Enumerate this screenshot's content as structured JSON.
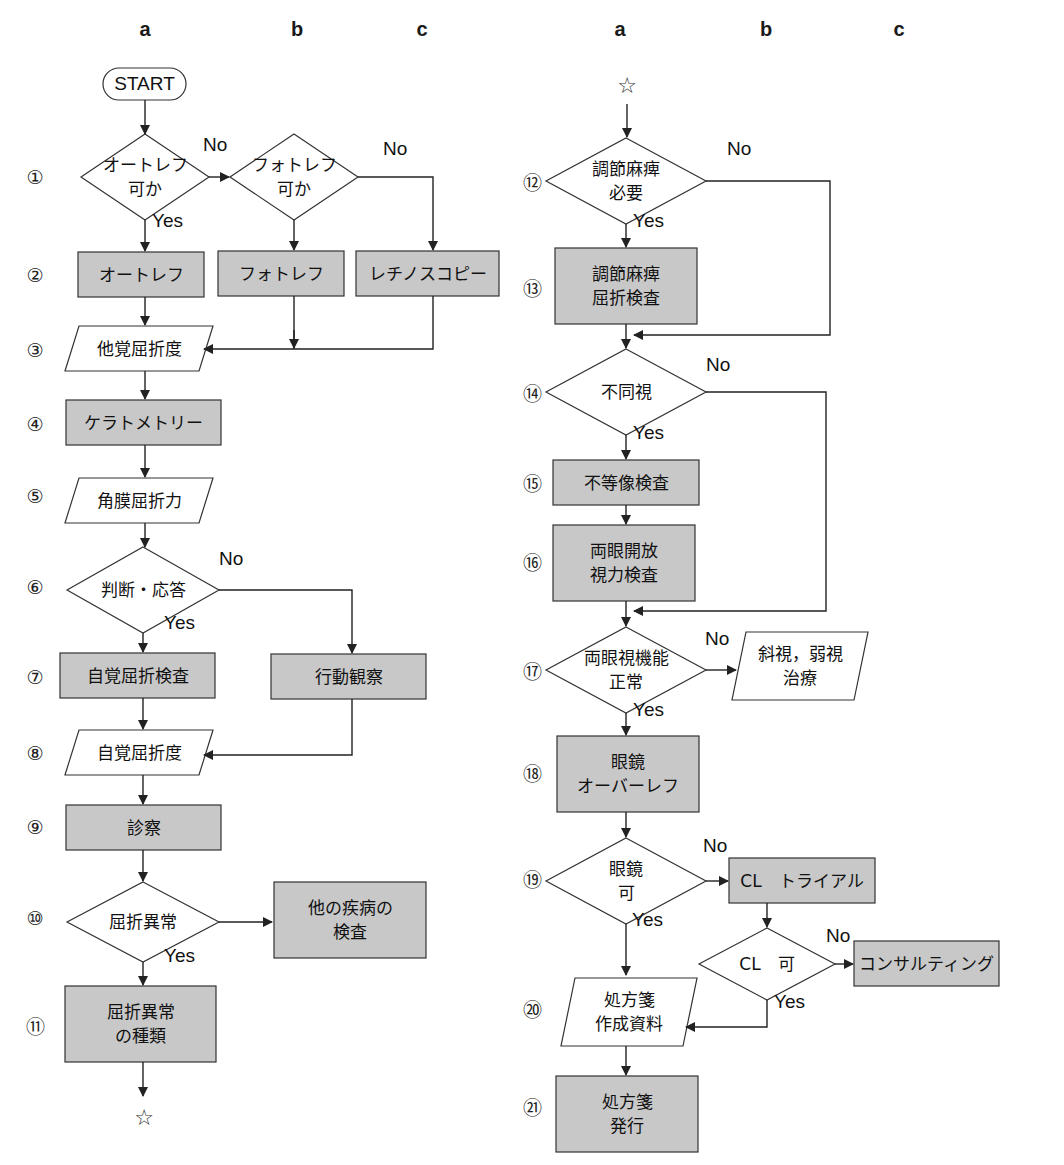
{
  "diagram": {
    "colors": {
      "process_fill": "#c8c8c8",
      "io_fill": "#ffffff",
      "stroke": "#333333",
      "line": "#222222"
    },
    "column_headers": [
      {
        "label": "a",
        "x": 145,
        "y": 30
      },
      {
        "label": "b",
        "x": 297,
        "y": 30
      },
      {
        "label": "c",
        "x": 422,
        "y": 30
      },
      {
        "label": "a",
        "x": 620,
        "y": 30
      },
      {
        "label": "b",
        "x": 766,
        "y": 30
      },
      {
        "label": "c",
        "x": 899,
        "y": 30
      }
    ],
    "step_numbers": [
      {
        "label": "①",
        "x": 35,
        "y": 177
      },
      {
        "label": "②",
        "x": 35,
        "y": 275
      },
      {
        "label": "③",
        "x": 35,
        "y": 350
      },
      {
        "label": "④",
        "x": 35,
        "y": 424
      },
      {
        "label": "⑤",
        "x": 35,
        "y": 496
      },
      {
        "label": "⑥",
        "x": 35,
        "y": 587
      },
      {
        "label": "⑦",
        "x": 35,
        "y": 677
      },
      {
        "label": "⑧",
        "x": 35,
        "y": 753
      },
      {
        "label": "⑨",
        "x": 35,
        "y": 827
      },
      {
        "label": "⑩",
        "x": 35,
        "y": 918
      },
      {
        "label": "⑪",
        "x": 35,
        "y": 1025
      },
      {
        "label": "⑫",
        "x": 532,
        "y": 181
      },
      {
        "label": "⑬",
        "x": 532,
        "y": 287
      },
      {
        "label": "⑭",
        "x": 532,
        "y": 392
      },
      {
        "label": "⑮",
        "x": 532,
        "y": 482
      },
      {
        "label": "⑯",
        "x": 532,
        "y": 561
      },
      {
        "label": "⑰",
        "x": 532,
        "y": 670
      },
      {
        "label": "⑱",
        "x": 532,
        "y": 772
      },
      {
        "label": "⑲",
        "x": 532,
        "y": 878
      },
      {
        "label": "⑳",
        "x": 532,
        "y": 1008
      },
      {
        "label": "㉑",
        "x": 532,
        "y": 1106
      }
    ],
    "nodes": [
      {
        "id": "start",
        "type": "terminal",
        "label": "START",
        "x": 103,
        "y": 68,
        "w": 83,
        "h": 32
      },
      {
        "id": "n1a",
        "type": "decision",
        "label": "オートレフ\n可か",
        "cx": 145,
        "cy": 177,
        "w": 128,
        "h": 86
      },
      {
        "id": "n1b",
        "type": "decision",
        "label": "フォトレフ\n可か",
        "cx": 294,
        "cy": 177,
        "w": 128,
        "h": 86
      },
      {
        "id": "n2a",
        "type": "process",
        "label": "オートレフ",
        "x": 78,
        "y": 252,
        "w": 126,
        "h": 45
      },
      {
        "id": "n2b",
        "type": "process",
        "label": "フォトレフ",
        "x": 218,
        "y": 251,
        "w": 126,
        "h": 45
      },
      {
        "id": "n2c",
        "type": "process",
        "label": "レチノスコピー",
        "x": 356,
        "y": 251,
        "w": 143,
        "h": 45
      },
      {
        "id": "n3",
        "type": "io",
        "label": "他覚屈折度",
        "x": 65,
        "y": 326,
        "w": 148,
        "h": 45
      },
      {
        "id": "n4",
        "type": "process",
        "label": "ケラトメトリー",
        "x": 66,
        "y": 400,
        "w": 155,
        "h": 45
      },
      {
        "id": "n5",
        "type": "io",
        "label": "角膜屈折力",
        "x": 65,
        "y": 478,
        "w": 148,
        "h": 45
      },
      {
        "id": "n6",
        "type": "decision",
        "label": "判断・応答",
        "cx": 143,
        "cy": 590,
        "w": 152,
        "h": 86
      },
      {
        "id": "n7a",
        "type": "process",
        "label": "自覚屈折検査",
        "x": 60,
        "y": 653,
        "w": 155,
        "h": 45
      },
      {
        "id": "n7b",
        "type": "process",
        "label": "行動観察",
        "x": 271,
        "y": 654,
        "w": 155,
        "h": 45
      },
      {
        "id": "n8",
        "type": "io",
        "label": "自覚屈折度",
        "x": 65,
        "y": 730,
        "w": 148,
        "h": 45
      },
      {
        "id": "n9",
        "type": "process",
        "label": "診察",
        "x": 66,
        "y": 805,
        "w": 155,
        "h": 45
      },
      {
        "id": "n10a",
        "type": "decision",
        "label": "屈折異常",
        "cx": 143,
        "cy": 922,
        "w": 152,
        "h": 80
      },
      {
        "id": "n10b",
        "type": "process",
        "label": "他の疾病の\n検査",
        "x": 274,
        "y": 882,
        "w": 152,
        "h": 76
      },
      {
        "id": "n11",
        "type": "process",
        "label": "屈折異常\nの種類",
        "x": 65,
        "y": 986,
        "w": 151,
        "h": 76
      },
      {
        "id": "n12",
        "type": "decision",
        "label": "調節麻痺\n必要",
        "cx": 626,
        "cy": 181,
        "w": 160,
        "h": 86
      },
      {
        "id": "n13",
        "type": "process",
        "label": "調節麻痺\n屈折検査",
        "x": 555,
        "y": 248,
        "w": 142,
        "h": 76
      },
      {
        "id": "n14",
        "type": "decision",
        "label": "不同視",
        "cx": 626,
        "cy": 392,
        "w": 160,
        "h": 86
      },
      {
        "id": "n15",
        "type": "process",
        "label": "不等像検査",
        "x": 553,
        "y": 460,
        "w": 146,
        "h": 45
      },
      {
        "id": "n16",
        "type": "process",
        "label": "両眼開放\n視力検査",
        "x": 553,
        "y": 525,
        "w": 142,
        "h": 76
      },
      {
        "id": "n17a",
        "type": "decision",
        "label": "両眼視機能\n正常",
        "cx": 626,
        "cy": 670,
        "w": 160,
        "h": 86
      },
      {
        "id": "n17b",
        "type": "io",
        "label": "斜視，弱視\n治療",
        "x": 732,
        "y": 632,
        "w": 136,
        "h": 68
      },
      {
        "id": "n18",
        "type": "process",
        "label": "眼鏡\nオーバーレフ",
        "x": 557,
        "y": 736,
        "w": 142,
        "h": 76
      },
      {
        "id": "n19a",
        "type": "decision",
        "label": "眼鏡\n可",
        "cx": 626,
        "cy": 881,
        "w": 160,
        "h": 86
      },
      {
        "id": "n19b",
        "type": "process",
        "label": "CL　トライアル",
        "x": 729,
        "y": 858,
        "w": 146,
        "h": 45
      },
      {
        "id": "n19c",
        "type": "decision",
        "label": "CL　可",
        "cx": 767,
        "cy": 964,
        "w": 136,
        "h": 72
      },
      {
        "id": "n19d",
        "type": "process",
        "label": "コンサルティング",
        "x": 854,
        "y": 941,
        "w": 145,
        "h": 45
      },
      {
        "id": "n20",
        "type": "io",
        "label": "処方箋\n作成資料",
        "x": 561,
        "y": 978,
        "w": 136,
        "h": 68
      },
      {
        "id": "n21",
        "type": "process",
        "label": "処方箋\n発行",
        "x": 556,
        "y": 1076,
        "w": 142,
        "h": 76
      }
    ],
    "edge_labels": [
      {
        "label": "No",
        "x": 203,
        "y": 148
      },
      {
        "label": "Yes",
        "x": 152,
        "y": 224
      },
      {
        "label": "No",
        "x": 383,
        "y": 152
      },
      {
        "label": "No",
        "x": 219,
        "y": 562
      },
      {
        "label": "Yes",
        "x": 164,
        "y": 626
      },
      {
        "label": "Yes",
        "x": 164,
        "y": 959
      },
      {
        "label": "No",
        "x": 727,
        "y": 152
      },
      {
        "label": "Yes",
        "x": 633,
        "y": 224
      },
      {
        "label": "No",
        "x": 706,
        "y": 368
      },
      {
        "label": "Yes",
        "x": 633,
        "y": 436
      },
      {
        "label": "No",
        "x": 705,
        "y": 642
      },
      {
        "label": "Yes",
        "x": 633,
        "y": 713
      },
      {
        "label": "No",
        "x": 703,
        "y": 849
      },
      {
        "label": "Yes",
        "x": 632,
        "y": 923
      },
      {
        "label": "No",
        "x": 826,
        "y": 939
      },
      {
        "label": "Yes",
        "x": 774,
        "y": 1005
      }
    ],
    "connectors": [
      {
        "label": "☆",
        "x": 144,
        "y": 1117
      },
      {
        "label": "☆",
        "x": 627,
        "y": 85
      }
    ]
  }
}
